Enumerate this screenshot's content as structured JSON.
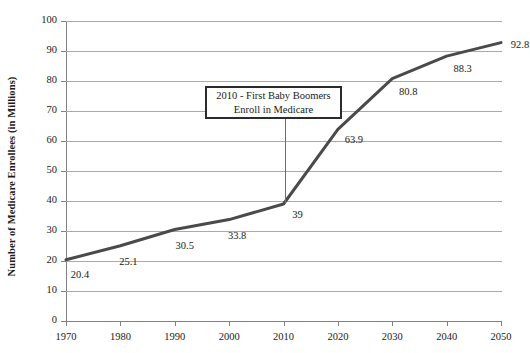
{
  "chart_data": {
    "type": "line",
    "title": "",
    "xlabel": "",
    "ylabel": "Number of Medicare Enrollees (in Millions)",
    "categories": [
      "1970",
      "1980",
      "1990",
      "2000",
      "2010",
      "2020",
      "2030",
      "2040",
      "2050"
    ],
    "values": [
      20.4,
      25.1,
      30.5,
      33.8,
      39,
      63.9,
      80.8,
      88.3,
      92.8
    ],
    "point_labels": [
      "20.4",
      "25.1",
      "30.5",
      "33.8",
      "39",
      "63.9",
      "80.8",
      "88.3",
      "92.8"
    ],
    "xlim": [
      1970,
      2050
    ],
    "ylim": [
      0,
      100
    ],
    "y_ticks": [
      "0",
      "10",
      "20",
      "30",
      "40",
      "50",
      "60",
      "70",
      "80",
      "90",
      "100"
    ],
    "x_ticks": [
      "1970",
      "1980",
      "1990",
      "2000",
      "2010",
      "2020",
      "2030",
      "2040",
      "2050"
    ],
    "grid": "horizontal",
    "legend": "none",
    "series_color": "#4a4a4a",
    "gridline_color": "#a9a9a9",
    "axis_color": "#808080",
    "annotations": [
      {
        "line1": "2010 - First Baby Boomers",
        "line2": "Enroll in Medicare",
        "target_category": "2010",
        "target_value": 39
      }
    ]
  }
}
